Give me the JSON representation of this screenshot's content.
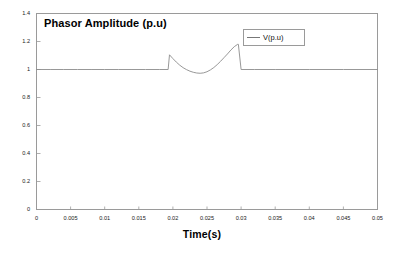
{
  "chart_data": {
    "type": "line",
    "title": "Phasor Amplitude (p.u)",
    "xlabel": "Time(s)",
    "ylabel": "",
    "xlim": [
      0,
      0.05
    ],
    "ylim": [
      0,
      1.4
    ],
    "grid": false,
    "legend_position": "top-right",
    "xticks": [
      "0",
      "0.005",
      "0.01",
      "0.015",
      "0.02",
      "0.025",
      "0.03",
      "0.035",
      "0.04",
      "0.045",
      "0.05"
    ],
    "xtick_values": [
      0,
      0.005,
      0.01,
      0.015,
      0.02,
      0.025,
      0.03,
      0.035,
      0.04,
      0.045,
      0.05
    ],
    "yticks": [
      "0",
      "0.2",
      "0.4",
      "0.6",
      "0.8",
      "1",
      "1.2",
      "1.4"
    ],
    "ytick_values": [
      0,
      0.2,
      0.4,
      0.6,
      0.8,
      1.0,
      1.2,
      1.4
    ],
    "series": [
      {
        "name": "V(p.u)",
        "color": "#8c8c8c",
        "x": [
          0,
          0.002,
          0.004,
          0.006,
          0.008,
          0.01,
          0.012,
          0.014,
          0.016,
          0.018,
          0.0193,
          0.0195,
          0.02,
          0.0205,
          0.021,
          0.0215,
          0.022,
          0.0225,
          0.023,
          0.0235,
          0.024,
          0.0245,
          0.025,
          0.0255,
          0.026,
          0.0265,
          0.027,
          0.0275,
          0.028,
          0.0285,
          0.029,
          0.0295,
          0.0296,
          0.03,
          0.032,
          0.035,
          0.04,
          0.045,
          0.05
        ],
        "y": [
          1.0,
          1.0,
          1.0,
          1.0,
          1.0,
          1.0,
          1.0,
          1.0,
          1.0,
          1.0,
          1.0,
          1.105,
          1.078,
          1.053,
          1.031,
          1.013,
          0.999,
          0.988,
          0.98,
          0.975,
          0.973,
          0.976,
          0.984,
          0.997,
          1.014,
          1.035,
          1.059,
          1.085,
          1.111,
          1.139,
          1.163,
          1.18,
          1.18,
          1.0,
          1.0,
          1.0,
          1.0,
          1.0,
          1.0
        ]
      }
    ],
    "annotations": []
  },
  "legend": {
    "entries": [
      {
        "label": "V(p.u)",
        "sample_name": "legend-line-sample"
      }
    ]
  },
  "axes": {
    "frame_color": "#9a9a9a",
    "tick_color": "#9a9a9a"
  }
}
